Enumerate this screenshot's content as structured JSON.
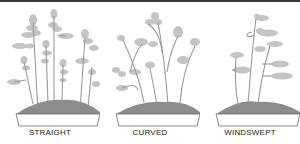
{
  "figure": {
    "panels": [
      {
        "label": "STRAIGHT",
        "style": "straight"
      },
      {
        "label": "CURVED",
        "style": "curved"
      },
      {
        "label": "WINDSWEPT",
        "style": "windswept"
      }
    ]
  },
  "colors": {
    "foliage": "#c4c4c4",
    "trunk": "#9a9a9a",
    "soil": "#8c8c8c",
    "pot_outline": "#6a6a6a",
    "rule": "#3a3a3a",
    "text": "#1a1a1a"
  }
}
